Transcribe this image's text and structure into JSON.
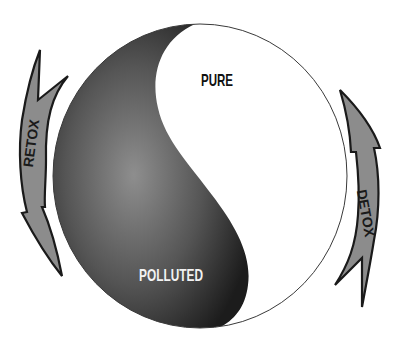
{
  "diagram": {
    "halves": {
      "pure": {
        "label": "PURE",
        "fill": "#ffffff"
      },
      "polluted": {
        "label": "POLLUTED",
        "fill_dark": "#1e1e1e",
        "fill_light": "#8a8a8a"
      }
    },
    "arrows": {
      "retox": {
        "label": "RETOX",
        "direction": "down",
        "side": "left",
        "fill": "#8c8c8c",
        "outline": "#1a1a1a"
      },
      "detox": {
        "label": "DETOX",
        "direction": "up",
        "side": "right",
        "fill": "#8c8c8c",
        "outline": "#1a1a1a"
      }
    },
    "circle_outline": "#333333"
  }
}
